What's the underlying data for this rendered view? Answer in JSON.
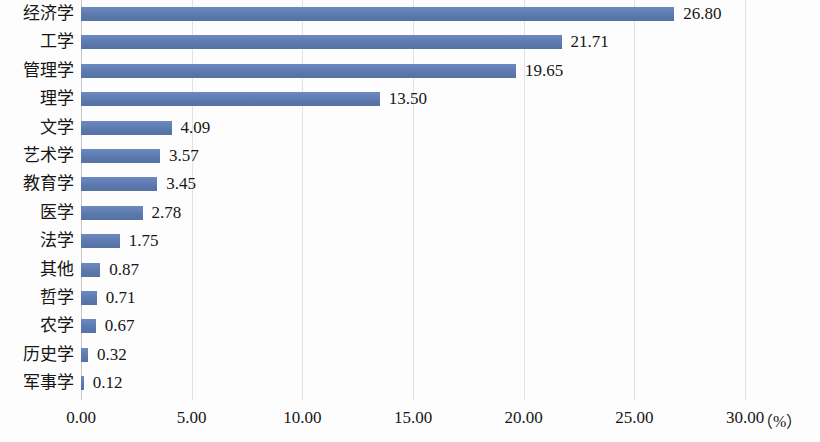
{
  "chart_data": {
    "type": "bar",
    "orientation": "horizontal",
    "title": "",
    "subtitle": "",
    "xlabel": "（%）",
    "ylabel": "",
    "xlim": [
      0,
      30
    ],
    "xticks": [
      "0.00",
      "5.00",
      "10.00",
      "15.00",
      "20.00",
      "25.00",
      "30.00"
    ],
    "xtick_values": [
      0,
      5,
      10,
      15,
      20,
      25,
      30
    ],
    "grid": true,
    "legend": false,
    "categories": [
      "经济学",
      "工学",
      "管理学",
      "理学",
      "文学",
      "艺术学",
      "教育学",
      "医学",
      "法学",
      "其他",
      "哲学",
      "农学",
      "历史学",
      "军事学"
    ],
    "values": [
      26.8,
      21.71,
      19.65,
      13.5,
      4.09,
      3.57,
      3.45,
      2.78,
      1.75,
      0.87,
      0.71,
      0.67,
      0.32,
      0.12
    ],
    "value_labels": [
      "26.80",
      "21.71",
      "19.65",
      "13.50",
      "4.09",
      "3.57",
      "3.45",
      "2.78",
      "1.75",
      "0.87",
      "0.71",
      "0.67",
      "0.32",
      "0.12"
    ],
    "series": [
      {
        "name": "占比",
        "values": [
          26.8,
          21.71,
          19.65,
          13.5,
          4.09,
          3.57,
          3.45,
          2.78,
          1.75,
          0.87,
          0.71,
          0.67,
          0.32,
          0.12
        ]
      }
    ]
  },
  "colors": {
    "bar": "#5c79b0",
    "bar_light": "#6d8ac0",
    "gridline": "#e2e2e2",
    "axis": "#c9c9c9",
    "text": "#161616",
    "background": "#fdfdfd"
  }
}
